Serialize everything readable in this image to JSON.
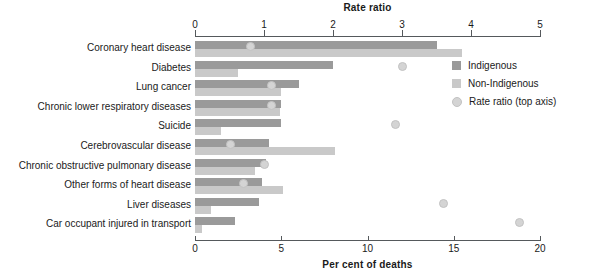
{
  "chart_data": {
    "type": "bar",
    "title": "",
    "orientation": "horizontal",
    "grid": false,
    "legend_position": "top-right",
    "top_axis": {
      "label": "Rate ratio",
      "ticks": [
        0,
        1,
        2,
        3,
        4,
        5
      ],
      "range": [
        0,
        5
      ]
    },
    "bottom_axis": {
      "label": "Per cent of deaths",
      "ticks": [
        0,
        5,
        10,
        15,
        20
      ],
      "range": [
        0,
        20
      ]
    },
    "categories": [
      "Coronary heart disease",
      "Diabetes",
      "Lung cancer",
      "Chronic lower respiratory diseases",
      "Suicide",
      "Cerebrovascular disease",
      "Chronic obstructive pulmonary disease",
      "Other forms of heart disease",
      "Liver diseases",
      "Car occupant injured in transport"
    ],
    "series": [
      {
        "name": "Indigenous",
        "axis": "bottom",
        "unit": "per cent of deaths",
        "color": "#9a9a9a",
        "values": [
          14.0,
          8.0,
          6.0,
          5.0,
          5.0,
          4.3,
          4.1,
          3.9,
          3.7,
          2.3
        ]
      },
      {
        "name": "Non-Indigenous",
        "axis": "bottom",
        "unit": "per cent of deaths",
        "color": "#c9c9c9",
        "values": [
          15.5,
          2.5,
          5.0,
          4.9,
          1.5,
          8.1,
          3.5,
          5.1,
          0.9,
          0.4
        ]
      },
      {
        "name": "Rate ratio (top axis)",
        "axis": "top",
        "unit": "rate ratio",
        "marker": "circle",
        "color": "#d4d4d4",
        "values": [
          0.8,
          3.0,
          1.1,
          1.1,
          2.9,
          0.5,
          1.0,
          0.7,
          3.6,
          4.7
        ]
      }
    ]
  },
  "legend": {
    "items": [
      {
        "label": "Indigenous",
        "marker": "square",
        "color": "#9a9a9a"
      },
      {
        "label": "Non-Indigenous",
        "marker": "square",
        "color": "#c9c9c9"
      },
      {
        "label": "Rate ratio (top axis)",
        "marker": "circle",
        "color": "#d4d4d4"
      }
    ]
  }
}
